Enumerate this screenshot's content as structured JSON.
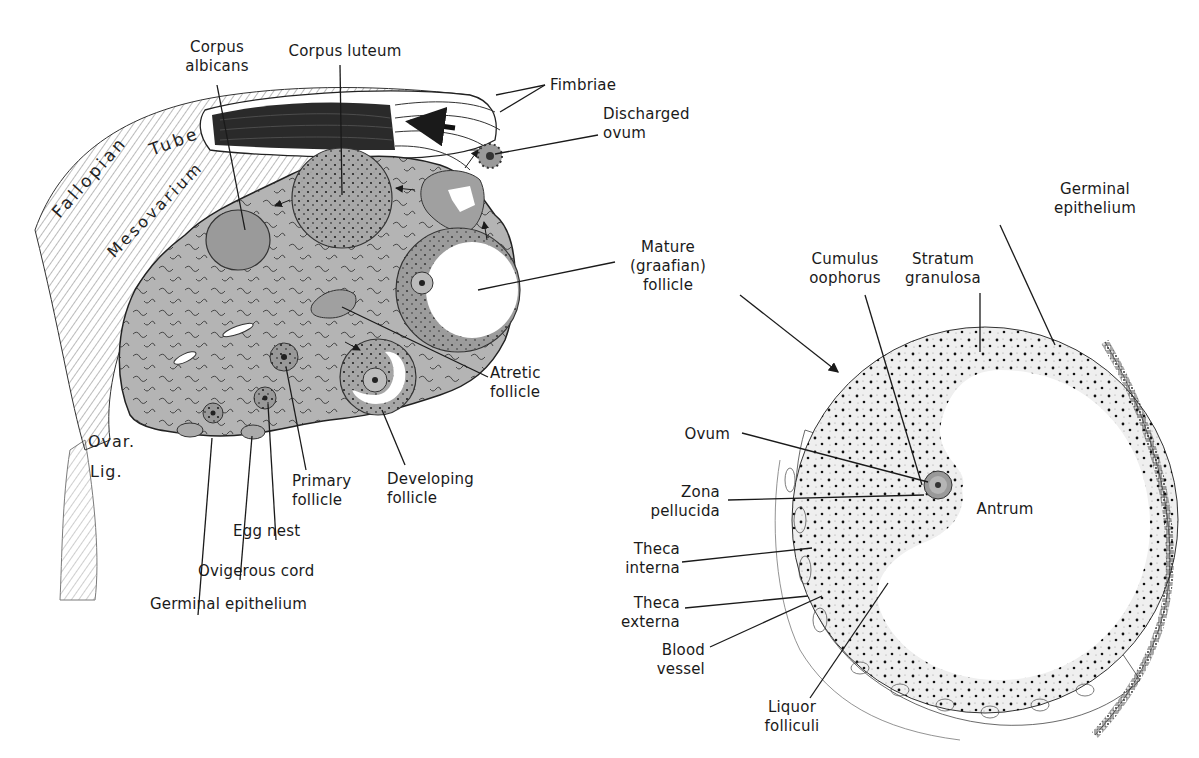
{
  "figure": {
    "left_panel": {
      "title": "Ovary section with surrounding structures",
      "handwritten_labels": {
        "fallopian": "Fallopian",
        "tube": "Tube",
        "mesovarium": "Mesovarium",
        "ovar": "Ovar.",
        "lig": "Lig."
      },
      "labels": {
        "corpus_albicans": "Corpus\nalbicans",
        "corpus_luteum": "Corpus luteum",
        "fimbriae": "Fimbriae",
        "discharged_ovum": "Discharged\novum",
        "mature_follicle": "Mature\n(graafian)\nfollicle",
        "atretic_follicle": "Atretic\nfollicle",
        "developing_follicle": "Developing\nfollicle",
        "primary_follicle": "Primary\nfollicle",
        "egg_nest": "Egg nest",
        "ovigerous_cord": "Ovigerous cord",
        "germinal_epithelium": "Germinal epithelium"
      }
    },
    "right_panel": {
      "title": "Mature (graafian) follicle detail",
      "labels": {
        "germinal_epithelium": "Germinal\nepithelium",
        "cumulus_oophorus": "Cumulus\noophorus",
        "stratum_granulosa": "Stratum\ngranulosa",
        "ovum": "Ovum",
        "zona_pellucida": "Zona\npellucida",
        "antrum": "Antrum",
        "theca_interna": "Theca\ninterna",
        "theca_externa": "Theca\nexterna",
        "blood_vessel": "Blood\nvessel",
        "liquor_folliculi": "Liquor\nfolliculi"
      }
    },
    "colors": {
      "stroma_fill": "#b4b4b4",
      "line": "#1a1a1a",
      "background": "#ffffff"
    }
  }
}
